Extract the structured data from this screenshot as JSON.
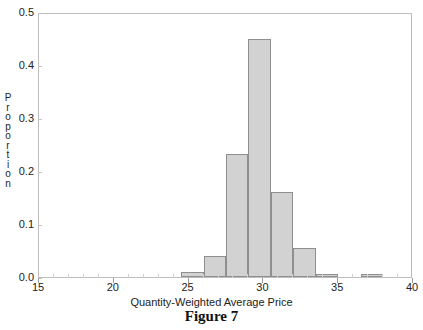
{
  "caption": "Figure 7",
  "top_cut_text": {
    "left": "",
    "right": ""
  },
  "chart_data": {
    "type": "bar",
    "title": "",
    "subtitle": "",
    "xlabel": "Quantity-Weighted Average Price",
    "ylabel": "Proportion",
    "ylabel_letters": [
      "P",
      "r",
      "o",
      "p",
      "o",
      "r",
      "t",
      "i",
      "o",
      "n"
    ],
    "xlim": [
      15,
      40
    ],
    "ylim": [
      0.0,
      0.5
    ],
    "xticks": [
      15,
      20,
      25,
      30,
      35,
      40
    ],
    "xtick_labels": [
      "15",
      "20",
      "25",
      "30",
      "35",
      "40"
    ],
    "yticks": [
      0.0,
      0.1,
      0.2,
      0.3,
      0.4,
      0.5
    ],
    "ytick_labels": [
      "0.0",
      "0.1",
      "0.2",
      "0.3",
      "0.4",
      "0.5"
    ],
    "grid": false,
    "legend": null,
    "bar_fill_color": "#d2d2d2",
    "bar_edge_color": "#8f8f8f",
    "bin_width": 1.5,
    "bins": [
      {
        "x0": 24.5,
        "x1": 26.0,
        "value": 0.01
      },
      {
        "x0": 26.0,
        "x1": 27.5,
        "value": 0.04
      },
      {
        "x0": 27.5,
        "x1": 29.0,
        "value": 0.232
      },
      {
        "x0": 29.0,
        "x1": 30.5,
        "value": 0.45
      },
      {
        "x0": 30.5,
        "x1": 32.0,
        "value": 0.16
      },
      {
        "x0": 32.0,
        "x1": 33.5,
        "value": 0.055
      },
      {
        "x0": 33.5,
        "x1": 35.0,
        "value": 0.005
      },
      {
        "x0": 36.5,
        "x1": 38.0,
        "value": 0.005
      }
    ],
    "categories": [
      "24.5-26.0",
      "26.0-27.5",
      "27.5-29.0",
      "29.0-30.5",
      "30.5-32.0",
      "32.0-33.5",
      "33.5-35.0",
      "36.5-38.0"
    ],
    "values": [
      0.01,
      0.04,
      0.232,
      0.45,
      0.16,
      0.055,
      0.005,
      0.005
    ]
  }
}
